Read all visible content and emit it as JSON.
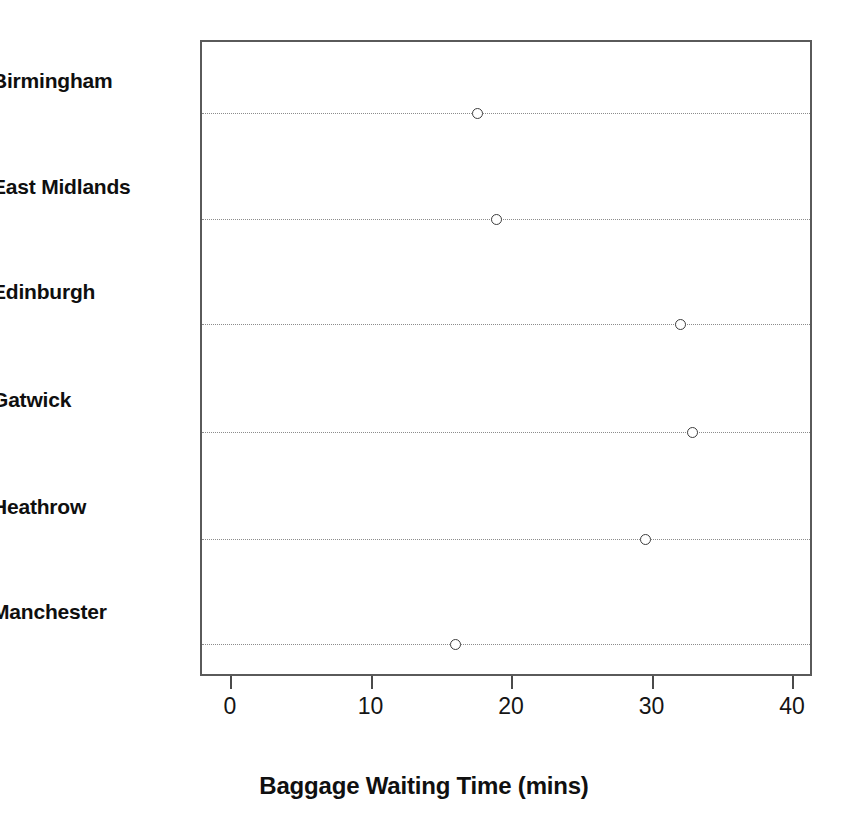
{
  "chart_data": {
    "type": "scatter",
    "subtype": "dot-plot",
    "title": "",
    "xlabel": "Baggage Waiting Time (mins)",
    "ylabel": "",
    "categories": [
      "Birmingham",
      "East Midlands",
      "Edinburgh",
      "Gatwick",
      "Heathrow",
      "Manchester"
    ],
    "values": [
      17.5,
      18.8,
      31.9,
      32.8,
      29.4,
      15.9
    ],
    "points": [
      {
        "category": "Birmingham",
        "value": 17.5
      },
      {
        "category": "East Midlands",
        "value": 18.8
      },
      {
        "category": "Edinburgh",
        "value": 31.9
      },
      {
        "category": "Gatwick",
        "value": 32.8
      },
      {
        "category": "Heathrow",
        "value": 29.4
      },
      {
        "category": "Manchester",
        "value": 15.9
      }
    ],
    "xlim": [
      -1.5,
      42.0
    ],
    "xticks": [
      0,
      10,
      20,
      30,
      40
    ],
    "xtick_labels": [
      "0",
      "10",
      "20",
      "30",
      "40"
    ],
    "grid": "horizontal-dotted",
    "legend": "none",
    "marker": "open-circle",
    "colors": {
      "marker_edge": "#3d3d3d",
      "marker_fill": "#ffffff",
      "gridline": "#8c8c8c",
      "frame": "#5a5a5a",
      "text": "#101010",
      "background": "#ffffff"
    }
  },
  "axis": {
    "x_title": "Baggage Waiting Time (mins)"
  }
}
